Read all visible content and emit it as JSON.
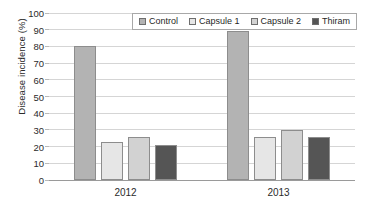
{
  "chart_data": {
    "type": "bar",
    "title": "",
    "subtitle": "",
    "xlabel": "",
    "ylabel": "Disease incidence (%)",
    "categories": [
      "2012",
      "2013"
    ],
    "series": [
      {
        "name": "Control",
        "values": [
          80,
          89
        ],
        "color": "#b3b3b3"
      },
      {
        "name": "Capsule 1",
        "values": [
          23,
          26
        ],
        "color": "#e6e6e6"
      },
      {
        "name": "Capsule 2",
        "values": [
          26,
          30
        ],
        "color": "#d2d2d2"
      },
      {
        "name": "Thiram",
        "values": [
          21,
          26
        ],
        "color": "#555555"
      }
    ],
    "ylim": [
      0,
      100
    ],
    "ytick_step": 10,
    "yticks": [
      "0",
      "10",
      "20",
      "30",
      "40",
      "50",
      "60",
      "70",
      "80",
      "90",
      "100"
    ],
    "grid": true,
    "legend_position": "top-center",
    "legend_orientation": "horizontal"
  }
}
